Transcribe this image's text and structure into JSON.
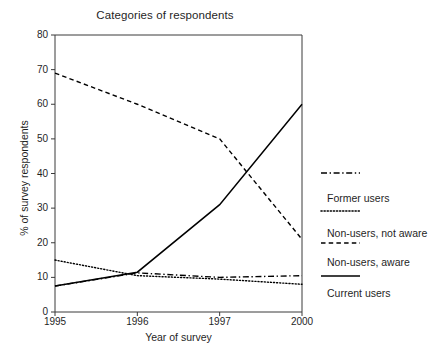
{
  "chart_data": {
    "type": "line",
    "title": "Categories of respondents",
    "xlabel": "Year of survey",
    "ylabel": "% of survey respondents",
    "categories": [
      "1995",
      "1996",
      "1997",
      "2000"
    ],
    "ylim": [
      0,
      80
    ],
    "yticks": [
      0,
      10,
      20,
      30,
      40,
      50,
      60,
      70,
      80
    ],
    "grid": false,
    "legend_position": "right",
    "series": [
      {
        "name": "Former users",
        "style": "dash-dot",
        "color": "#000000",
        "values": [
          7.5,
          11.3,
          10.0,
          10.5
        ]
      },
      {
        "name": "Non-users, not aware",
        "style": "dotted",
        "color": "#000000",
        "values": [
          15.0,
          10.5,
          9.5,
          8.0
        ]
      },
      {
        "name": "Non-users, aware",
        "style": "dashed",
        "color": "#000000",
        "values": [
          69.0,
          60.0,
          50.0,
          21.0
        ]
      },
      {
        "name": "Current users",
        "style": "solid",
        "color": "#000000",
        "values": [
          7.5,
          11.5,
          31.0,
          60.0
        ]
      }
    ]
  },
  "legend": {
    "items": [
      {
        "label": "Former users",
        "style": "dash-dot"
      },
      {
        "label": "Non-users, not aware",
        "style": "dotted"
      },
      {
        "label": "Non-users, aware",
        "style": "dashed"
      },
      {
        "label": "Current users",
        "style": "solid"
      }
    ]
  },
  "axes": {
    "y_tick_labels": [
      "80",
      "70",
      "60",
      "50",
      "40",
      "30",
      "20",
      "10",
      "0"
    ],
    "x_tick_labels": [
      "1995",
      "1996",
      "1997",
      "2000"
    ]
  }
}
